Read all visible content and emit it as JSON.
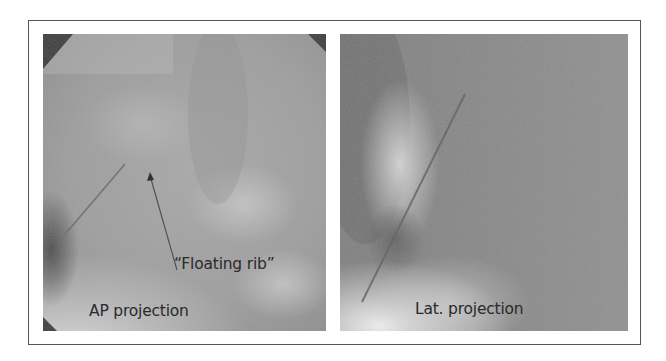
{
  "figure": {
    "panels": [
      {
        "id": "ap",
        "label": "AP projection",
        "annotation": "“Floating rib”",
        "annotation_target": "arrow pointing to floating rib tip"
      },
      {
        "id": "lat",
        "label": "Lat. projection"
      }
    ],
    "colors": {
      "frame": "#555555",
      "text": "#2a2a2a",
      "xray_mid": "#9a9a9a"
    }
  }
}
